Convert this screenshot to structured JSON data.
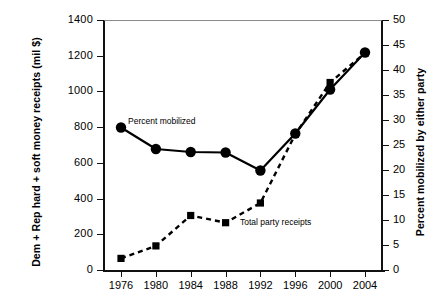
{
  "chart_data": {
    "type": "line",
    "title": "",
    "subtitle": "",
    "x": [
      1976,
      1980,
      1984,
      1988,
      1992,
      1996,
      2000,
      2004
    ],
    "categories": [
      "1976",
      "1980",
      "1984",
      "1988",
      "1992",
      "1996",
      "2000",
      "2004"
    ],
    "xlabel": "",
    "ylabel": "Dem + Rep hard + soft money receipts (mil $)",
    "y2label": "Percent mobilized by either party",
    "ylim": [
      0,
      1400
    ],
    "y2lim": [
      0,
      50
    ],
    "yticks": [
      0,
      200,
      400,
      600,
      800,
      1000,
      1200,
      1400
    ],
    "y2ticks": [
      0,
      5,
      10,
      15,
      20,
      25,
      30,
      35,
      40,
      45,
      50
    ],
    "grid": false,
    "legend_position": "inline-annotations",
    "series": [
      {
        "name": "Percent mobilized",
        "axis": "right",
        "marker": "circle",
        "linestyle": "solid",
        "color": "#000000",
        "values": [
          28.5,
          24.2,
          23.6,
          23.5,
          19.9,
          27.3,
          36.1,
          43.5
        ]
      },
      {
        "name": "Total party receipts",
        "axis": "left",
        "marker": "square",
        "linestyle": "dashed",
        "color": "#000000",
        "values": [
          65,
          135,
          305,
          265,
          375,
          760,
          1050,
          1215
        ]
      }
    ],
    "annotations": [
      {
        "text": "Percent mobilized",
        "x": 1980,
        "y": 870
      },
      {
        "text": "Total party receipts",
        "x": 1993,
        "y": 275
      }
    ]
  },
  "axes": {
    "left": {
      "title": "Dem + Rep hard + soft money receipts (mil $)",
      "labels": [
        "1400",
        "1200",
        "1000",
        "800",
        "600",
        "400",
        "200",
        "0"
      ]
    },
    "right": {
      "title": "Percent mobilized by either party",
      "labels": [
        "50",
        "45",
        "40",
        "35",
        "30",
        "25",
        "20",
        "15",
        "10",
        "5",
        "0"
      ]
    },
    "bottom": {
      "labels": [
        "1976",
        "1980",
        "1984",
        "1988",
        "1992",
        "1996",
        "2000",
        "2004"
      ]
    }
  },
  "annotations": {
    "mobilized": "Percent mobilized",
    "receipts": "Total party receipts"
  },
  "colors": {
    "line": "#000000",
    "axis": "#111111",
    "background": "#ffffff"
  }
}
